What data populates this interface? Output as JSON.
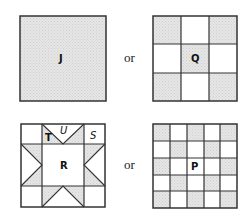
{
  "colors": {
    "shade": "#e3e3e3",
    "line": "#333333",
    "background": "#ffffff"
  },
  "top_row": {
    "left": {
      "label": "J",
      "description": "single solid shaded square"
    },
    "connector": "or",
    "right": {
      "label": "Q",
      "grid": "3x3",
      "shaded_cells": [
        [
          0,
          0
        ],
        [
          0,
          2
        ],
        [
          1,
          1
        ],
        [
          2,
          0
        ],
        [
          2,
          2
        ]
      ]
    }
  },
  "bottom_row": {
    "left": {
      "center_label": "R",
      "labels": [
        "T",
        "U",
        "S"
      ],
      "description": "sawtooth star quilt block: 3x3 grid with center square R, corner squares S, edge units with triangles T and U"
    },
    "connector": "or",
    "right": {
      "label": "P",
      "grid": "5x5",
      "shaded_cells": [
        [
          0,
          0
        ],
        [
          0,
          2
        ],
        [
          0,
          4
        ],
        [
          1,
          1
        ],
        [
          1,
          3
        ],
        [
          2,
          0
        ],
        [
          2,
          4
        ],
        [
          3,
          1
        ],
        [
          3,
          3
        ],
        [
          4,
          0
        ],
        [
          4,
          2
        ],
        [
          4,
          4
        ]
      ]
    }
  }
}
